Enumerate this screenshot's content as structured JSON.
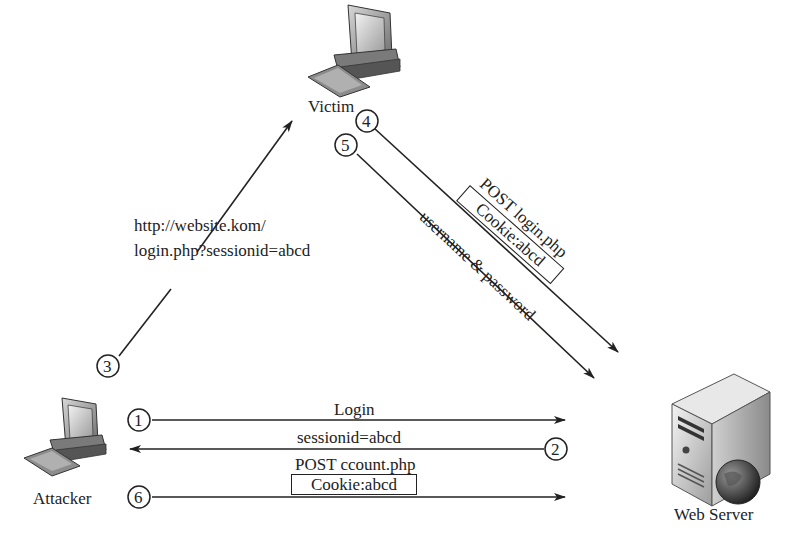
{
  "nodes": {
    "victim": {
      "label": "Victim"
    },
    "attacker": {
      "label": "Attacker"
    },
    "server": {
      "label": "Web Server"
    }
  },
  "steps": [
    {
      "number": "1",
      "from": "Attacker",
      "to": "Web Server",
      "label": "Login"
    },
    {
      "number": "2",
      "from": "Web Server",
      "to": "Attacker",
      "label": "sessionid=abcd"
    },
    {
      "number": "3",
      "from": "Attacker",
      "to": "Victim",
      "label_line1": "http://website.kom/",
      "label_line2": "login.php?sessionid=abcd"
    },
    {
      "number": "4",
      "from": "Victim",
      "to": "Web Server",
      "label": "POST login.php",
      "boxed_label": "Cookie:abcd"
    },
    {
      "number": "5",
      "from": "Victim",
      "to": "Web Server",
      "label": "username & password"
    },
    {
      "number": "6",
      "from": "Attacker",
      "to": "Web Server",
      "label": "POST ccount.php",
      "boxed_label": "Cookie:abcd"
    }
  ],
  "icons": {
    "victim": "desktop-computer-icon",
    "attacker": "desktop-computer-icon",
    "server": "web-server-globe-icon"
  },
  "colors": {
    "line": "#222222",
    "background": "#ffffff"
  }
}
